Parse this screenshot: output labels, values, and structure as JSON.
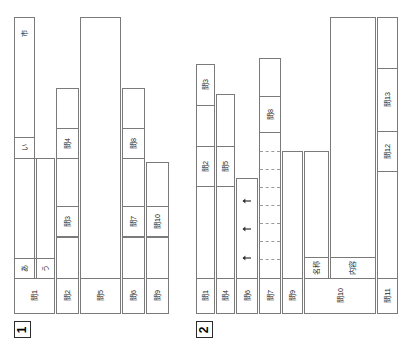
{
  "figure": {
    "type": "tree-diagram-pair",
    "orientation": "vertical-text-rotated-90",
    "background": "#ffffff",
    "line_color": "#7a7a7a",
    "text_color": "#1b1b1b"
  },
  "figures": [
    {
      "id": "fig1",
      "number": "1",
      "nodes": [
        {
          "key": "q1",
          "label": "問1"
        },
        {
          "key": "q2",
          "label": "問2"
        },
        {
          "key": "q5",
          "label": "問5"
        },
        {
          "key": "q6",
          "label": "問6"
        },
        {
          "key": "q9",
          "label": "問9"
        },
        {
          "key": "q3",
          "label": "問3"
        },
        {
          "key": "q4",
          "label": "問4"
        },
        {
          "key": "q7",
          "label": "問7"
        },
        {
          "key": "q8",
          "label": "問8"
        },
        {
          "key": "q10",
          "label": "問10"
        }
      ],
      "leaves": [
        {
          "key": "a",
          "label": "あ"
        },
        {
          "key": "u",
          "label": "う"
        },
        {
          "key": "shi1",
          "label": "市"
        },
        {
          "key": "shi2",
          "label": "市"
        },
        {
          "key": "i",
          "label": "い"
        },
        {
          "key": "shi3",
          "label": "市"
        }
      ]
    },
    {
      "id": "fig2",
      "number": "2",
      "nodes": [
        {
          "key": "q1",
          "label": "問1"
        },
        {
          "key": "q4",
          "label": "問4"
        },
        {
          "key": "q6",
          "label": "問6"
        },
        {
          "key": "q7",
          "label": "問7"
        },
        {
          "key": "q9",
          "label": "問9"
        },
        {
          "key": "q10",
          "label": "問10"
        },
        {
          "key": "q11",
          "label": "問11"
        },
        {
          "key": "q2",
          "label": "問2"
        },
        {
          "key": "q5",
          "label": "問5"
        },
        {
          "key": "q3",
          "label": "問3"
        },
        {
          "key": "q8",
          "label": "問8"
        },
        {
          "key": "q12",
          "label": "問12"
        },
        {
          "key": "q13",
          "label": "問13"
        }
      ],
      "leaves": [
        {
          "key": "meisho",
          "label": "名称"
        },
        {
          "key": "naiyo",
          "label": "内容"
        }
      ],
      "arrows": [
        {
          "key": "arrow1",
          "direction": "up"
        },
        {
          "key": "arrow2",
          "direction": "up"
        },
        {
          "key": "arrow3",
          "direction": "up"
        }
      ],
      "dashed_separators": 7
    }
  ]
}
